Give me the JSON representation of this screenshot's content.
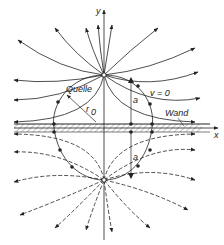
{
  "diagram": {
    "labels": {
      "y_axis": "y",
      "x_axis": "x",
      "source": "Quelle",
      "radius": "r0",
      "radius_sub": "0",
      "radius_main": "r",
      "velocity_zero": "v = 0",
      "distance_top": "a",
      "distance_bottom": "a",
      "wall": "Wand"
    },
    "colors": {
      "line": "#222222",
      "wall_hatch": "#444444",
      "background": "#ffffff"
    },
    "elements": {
      "real_source": {
        "x": 104,
        "y": 75
      },
      "image_source": {
        "x": 104,
        "y": 180
      },
      "wall_y": 128,
      "circle_radius": 50
    }
  }
}
